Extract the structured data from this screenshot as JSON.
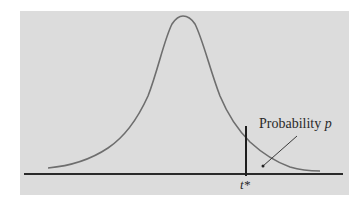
{
  "figure": {
    "type": "normal-density-curve",
    "annotation_label": "Probability",
    "annotation_var": "p",
    "critical_value_label": "t*",
    "colors": {
      "panel": "#dcdcdc",
      "curve": "#6e6e6e",
      "axis": "#2a2a2a",
      "cutoff_line": "#1e1e1e"
    }
  }
}
